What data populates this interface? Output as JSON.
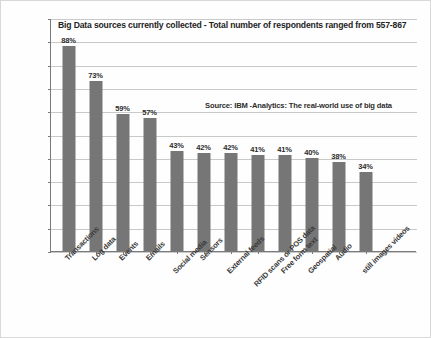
{
  "chart_data": {
    "type": "bar",
    "title": "Big Data sources currently collected - Total number of respondents ranged from 557-867",
    "subtitle": "",
    "annotation": "Source: IBM -Analytics: The real-world use of big data",
    "xlabel": "",
    "ylabel": "",
    "ylim": [
      0,
      100
    ],
    "ytick_step": 10,
    "grid": true,
    "legend": "none",
    "value_suffix": "%",
    "bar_color": "#767676",
    "categories": [
      "Transactions",
      "Log data",
      "Events",
      "Emails",
      "Social media",
      "Sensors",
      "External feeds",
      "RFID scans or POS data",
      "Free form text",
      "Geospatial",
      "Audio",
      "still images videos"
    ],
    "values": [
      88,
      73,
      59,
      57,
      43,
      42,
      42,
      41,
      41,
      40,
      38,
      34
    ],
    "value_labels": [
      "88%",
      "73%",
      "59%",
      "57%",
      "43%",
      "42%",
      "42%",
      "41%",
      "41%",
      "40%",
      "38%",
      "34%"
    ],
    "ytick_labels": [
      "100%",
      "90%",
      "80%",
      "70%",
      "60%",
      "50%",
      "40%",
      "30%",
      "20%",
      "10%",
      "0%"
    ],
    "ytick_values": [
      100,
      90,
      80,
      70,
      60,
      50,
      40,
      30,
      20,
      10,
      0
    ]
  }
}
